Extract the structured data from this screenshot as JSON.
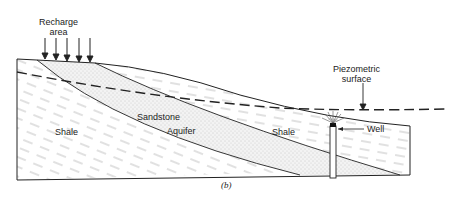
{
  "figure": {
    "caption": "(b)",
    "labels": {
      "recharge_line1": "Recharge",
      "recharge_line2": "area",
      "piezo_line1": "Piezometric",
      "piezo_line2": "surface",
      "shale_left": "Shale",
      "sandstone": "Sandstone",
      "aquifer": "Aquifer",
      "shale_right": "Shale",
      "well": "Well"
    },
    "colors": {
      "line": "#222222",
      "hatch": "#888888",
      "stipple": "#bbbbbb",
      "sand_fill": "#f1f1f1"
    }
  }
}
